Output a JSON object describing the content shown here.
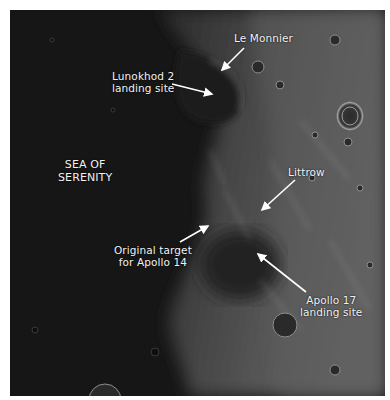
{
  "figure": {
    "colors": {
      "mare": "#161616",
      "highlands": "#5a5a5a",
      "label_text": "#f2f2f2",
      "arrow": "#ffffff",
      "border": "#ffffff"
    }
  },
  "labels": {
    "le_monnier": "Le Monnier",
    "lunokhod": "Lunokhod 2\nlanding site",
    "sea": "SEA OF\nSERENITY",
    "littrow": "Littrow",
    "original_target": "Original target\nfor Apollo 14",
    "apollo17": "Apollo 17\nlanding site"
  },
  "annotations": [
    {
      "name": "le-monnier",
      "from": [
        244,
        48
      ],
      "to": [
        222,
        70
      ]
    },
    {
      "name": "lunokhod-2",
      "from": [
        172,
        84
      ],
      "to": [
        212,
        94
      ]
    },
    {
      "name": "littrow",
      "from": [
        295,
        180
      ],
      "to": [
        262,
        210
      ]
    },
    {
      "name": "original-target-apollo-14",
      "from": [
        180,
        242
      ],
      "to": [
        208,
        226
      ]
    },
    {
      "name": "apollo-17",
      "from": [
        306,
        292
      ],
      "to": [
        258,
        254
      ]
    }
  ]
}
